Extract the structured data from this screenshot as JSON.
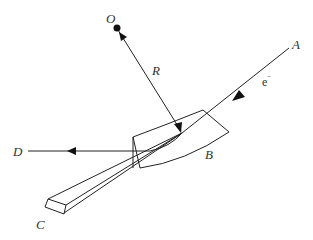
{
  "diagram": {
    "type": "physics-schematic",
    "labels": {
      "O": "O",
      "R": "R",
      "A": "A",
      "B": "B",
      "C": "C",
      "D": "D",
      "electron": "e",
      "electron_charge": "−"
    },
    "elements": [
      {
        "name": "center-point",
        "label": "O"
      },
      {
        "name": "radius-arrow",
        "label": "R"
      },
      {
        "name": "incident-electron-beam",
        "from": "A",
        "label": "e⁻"
      },
      {
        "name": "curved-crystal-plate",
        "label": "B"
      },
      {
        "name": "wedge-strip",
        "label": "C"
      },
      {
        "name": "emitted-beam",
        "to": "D"
      }
    ],
    "colors": {
      "line": "#222222",
      "text": "#333333",
      "background": "#ffffff"
    }
  }
}
